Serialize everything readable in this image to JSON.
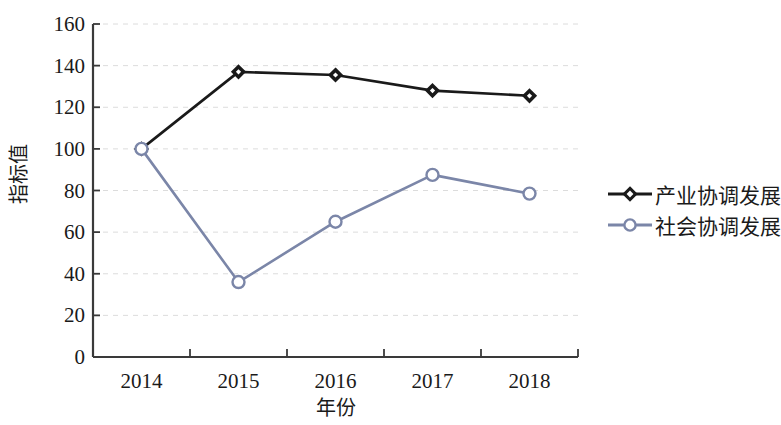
{
  "chart_data": {
    "type": "line",
    "title": "",
    "xlabel": "年份",
    "ylabel": "指标值",
    "categories": [
      "2014",
      "2015",
      "2016",
      "2017",
      "2018"
    ],
    "x": [
      2014,
      2015,
      2016,
      2017,
      2018
    ],
    "series": [
      {
        "name": "产业协调发展",
        "values": [
          100,
          137,
          135.5,
          128,
          125.5
        ],
        "color": "#1a1a1a",
        "marker": "diamond",
        "marker_fill": "#1a1a1a"
      },
      {
        "name": "社会协调发展",
        "values": [
          100,
          36,
          65,
          87.5,
          78.5
        ],
        "color": "#7b86a8",
        "marker": "circle",
        "marker_fill": "#ffffff"
      }
    ],
    "ylim": [
      0,
      160
    ],
    "ytick_values": [
      0,
      20,
      40,
      60,
      80,
      100,
      120,
      140,
      160
    ],
    "ytick_labels": [
      "0",
      "20",
      "40",
      "60",
      "80",
      "100",
      "120",
      "140",
      "160"
    ],
    "xtick_labels": [
      "2014",
      "2015",
      "2016",
      "2017",
      "2018"
    ],
    "grid": "horizontal-dashed",
    "legend_position": "right"
  },
  "legend": {
    "entries": [
      {
        "label": "产业协调发展"
      },
      {
        "label": "社会协调发展"
      }
    ]
  },
  "axes": {
    "x_title": "年份",
    "y_title": "指标值"
  },
  "colors": {
    "series_1": "#1a1a1a",
    "series_2": "#7b86a8",
    "axis": "#3a3a3a",
    "grid": "#dcdcdc",
    "background": "#ffffff"
  }
}
